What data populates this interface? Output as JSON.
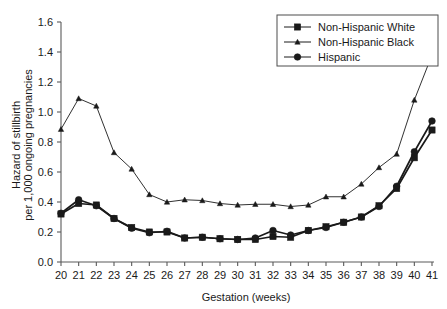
{
  "chart_data": {
    "type": "line",
    "title": "",
    "xlabel": "Gestation (weeks)",
    "ylabel_line1": "Hazard of stillbirth",
    "ylabel_line2": "per 1,000 ongoing pregnancies",
    "x": [
      20,
      21,
      22,
      23,
      24,
      25,
      26,
      27,
      28,
      29,
      30,
      31,
      32,
      33,
      34,
      35,
      36,
      37,
      38,
      39,
      40,
      41
    ],
    "xtick_labels": [
      "20",
      "21",
      "22",
      "23",
      "24",
      "25",
      "26",
      "27",
      "28",
      "29",
      "30",
      "31",
      "32",
      "33",
      "34",
      "35",
      "36",
      "37",
      "38",
      "39",
      "40",
      "41"
    ],
    "ytick_labels": [
      "0.0",
      "0.2",
      "0.4",
      "0.6",
      "0.8",
      "1.0",
      "1.2",
      "1.4",
      "1.6"
    ],
    "ytick_values": [
      0.0,
      0.2,
      0.4,
      0.6,
      0.8,
      1.0,
      1.2,
      1.4,
      1.6
    ],
    "xlim": [
      20,
      41
    ],
    "ylim": [
      0.0,
      1.6
    ],
    "grid": false,
    "legend_position": "top-right",
    "series": [
      {
        "name": "Non-Hispanic White",
        "marker": "square",
        "color": "#1a1a1a",
        "values": [
          0.32,
          0.39,
          0.38,
          0.29,
          0.23,
          0.2,
          0.2,
          0.16,
          0.165,
          0.155,
          0.15,
          0.15,
          0.17,
          0.165,
          0.21,
          0.235,
          0.265,
          0.3,
          0.375,
          0.49,
          0.695,
          0.88
        ]
      },
      {
        "name": "Non-Hispanic Black",
        "marker": "triangle",
        "color": "#1a1a1a",
        "values": [
          0.885,
          1.09,
          1.04,
          0.73,
          0.62,
          0.45,
          0.4,
          0.415,
          0.41,
          0.39,
          0.38,
          0.385,
          0.385,
          0.37,
          0.38,
          0.435,
          0.435,
          0.52,
          0.63,
          0.72,
          1.08,
          1.38
        ]
      },
      {
        "name": "Hispanic",
        "marker": "circle",
        "color": "#1a1a1a",
        "values": [
          0.325,
          0.415,
          0.375,
          0.29,
          0.225,
          0.195,
          0.205,
          0.16,
          0.165,
          0.155,
          0.15,
          0.16,
          0.21,
          0.18,
          0.21,
          0.23,
          0.265,
          0.3,
          0.37,
          0.505,
          0.735,
          0.94
        ]
      }
    ]
  },
  "legend": {
    "entries": [
      {
        "label": "Non-Hispanic White"
      },
      {
        "label": "Non-Hispanic Black"
      },
      {
        "label": "Hispanic"
      }
    ]
  }
}
